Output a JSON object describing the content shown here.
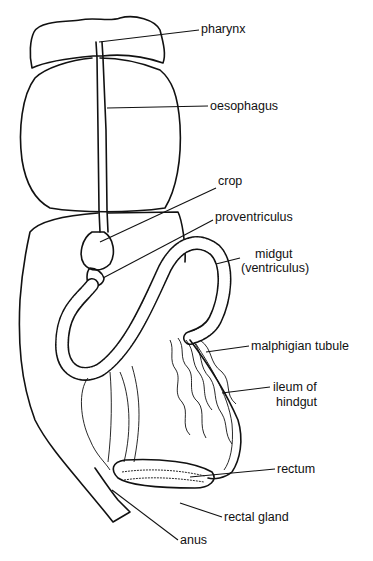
{
  "figure": {
    "labels": [
      {
        "id": "pharynx",
        "text": "pharynx",
        "x": 201,
        "y": 22
      },
      {
        "id": "oesophagus",
        "text": "oesophagus",
        "x": 210,
        "y": 98
      },
      {
        "id": "crop",
        "text": "crop",
        "x": 218,
        "y": 174
      },
      {
        "id": "proventriculus",
        "text": "proventriculus",
        "x": 215,
        "y": 210
      },
      {
        "id": "midgut",
        "text": "midgut",
        "x": 255,
        "y": 247
      },
      {
        "id": "midgut_alt",
        "text": "(ventriculus)",
        "x": 241,
        "y": 261
      },
      {
        "id": "malphigian_tubule",
        "text": "malphigian  tubule",
        "x": 251,
        "y": 339
      },
      {
        "id": "ileum",
        "text": "ileum  of",
        "x": 273,
        "y": 380
      },
      {
        "id": "ileum_alt",
        "text": "hindgut",
        "x": 276,
        "y": 395
      },
      {
        "id": "rectum",
        "text": "rectum",
        "x": 277,
        "y": 462
      },
      {
        "id": "rectal_gland",
        "text": "rectal  gland",
        "x": 224,
        "y": 510
      },
      {
        "id": "anus",
        "text": "anus",
        "x": 180,
        "y": 533
      }
    ]
  }
}
